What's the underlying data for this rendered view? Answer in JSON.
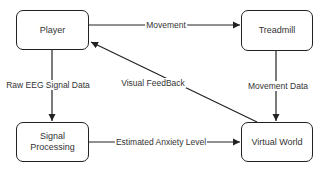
{
  "diagram": {
    "nodes": [
      {
        "id": "player",
        "label": "Player"
      },
      {
        "id": "treadmill",
        "label": "Treadmill"
      },
      {
        "id": "signal_processing",
        "label": "Signal\nProcessing"
      },
      {
        "id": "virtual_world",
        "label": "Virtual World"
      }
    ],
    "edges": [
      {
        "from": "player",
        "to": "treadmill",
        "label": "Movement"
      },
      {
        "from": "player",
        "to": "signal_processing",
        "label": "Raw EEG Signal Data"
      },
      {
        "from": "treadmill",
        "to": "virtual_world",
        "label": "Movement Data"
      },
      {
        "from": "virtual_world",
        "to": "player",
        "label": "Visual FeedBack"
      },
      {
        "from": "signal_processing",
        "to": "virtual_world",
        "label": "Estimated Anxiety Level"
      }
    ]
  },
  "colors": {
    "stroke": "#222222",
    "text": "#333333",
    "background": "#ffffff"
  }
}
